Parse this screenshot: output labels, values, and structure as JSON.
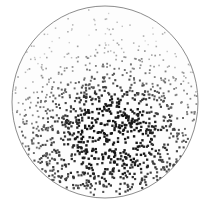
{
  "chart_data": {
    "type": "scatter",
    "title": "",
    "subtitle": "",
    "xlabel": "",
    "ylabel": "",
    "grid": false,
    "legend": false,
    "legend_position": "none",
    "axes_visible": false,
    "tick_labels": [],
    "annotations": [],
    "background_color": "#ffffff",
    "plot_area_shape": "circle",
    "plot_area": {
      "center_x": 105,
      "center_y": 102,
      "radius_x": 93,
      "radius_y": 96,
      "fill_color": "#fdfdfd",
      "outline_color": "#6f6f6f",
      "outline_width": 0.8
    },
    "xlim": [
      -1,
      1
    ],
    "ylim": [
      -1,
      1
    ],
    "marker": {
      "shape": "square",
      "size_px_min": 1.3,
      "size_px_max": 2.4
    },
    "density_model": {
      "description": "Radial-plus-vertical density and darkness gradient; point density and marker darkness both peak in a cluster just below the geometric center and fade toward the upper rim.",
      "peak_center_x": 112,
      "peak_center_y": 124,
      "peak_sigma_x": 46,
      "peak_sigma_y": 40,
      "total_points": 1180,
      "min_gray": "#d8d8d8",
      "max_gray": "#161616"
    },
    "series": [
      {
        "name": "points",
        "color_scale": [
          "#dcdcdc",
          "#1a1a1a"
        ],
        "n": 1180,
        "bands": [
          {
            "label": "upper-rim (lightest, sparse)",
            "y_range": [
              6,
              50
            ],
            "density_rel": 0.34,
            "gray": "#cfcfcf"
          },
          {
            "label": "upper-mid (light)",
            "y_range": [
              50,
              80
            ],
            "density_rel": 0.52,
            "gray": "#b4b4b4"
          },
          {
            "label": "mid transition",
            "y_range": [
              80,
              100
            ],
            "density_rel": 0.72,
            "gray": "#8a8a8a"
          },
          {
            "label": "core cluster (darkest, densest)",
            "y_range": [
              100,
              150
            ],
            "density_rel": 1.0,
            "gray": "#202020"
          },
          {
            "label": "lower-mid",
            "y_range": [
              150,
              175
            ],
            "density_rel": 0.6,
            "gray": "#2b2b2b"
          },
          {
            "label": "lower-rim (dark, sparse)",
            "y_range": [
              175,
              198
            ],
            "density_rel": 0.34,
            "gray": "#333333"
          }
        ]
      }
    ]
  },
  "figure": {
    "alt_text": "Circular scatter density plot of small square points; darkness and density increase toward a cluster just below center.",
    "caption": ""
  }
}
